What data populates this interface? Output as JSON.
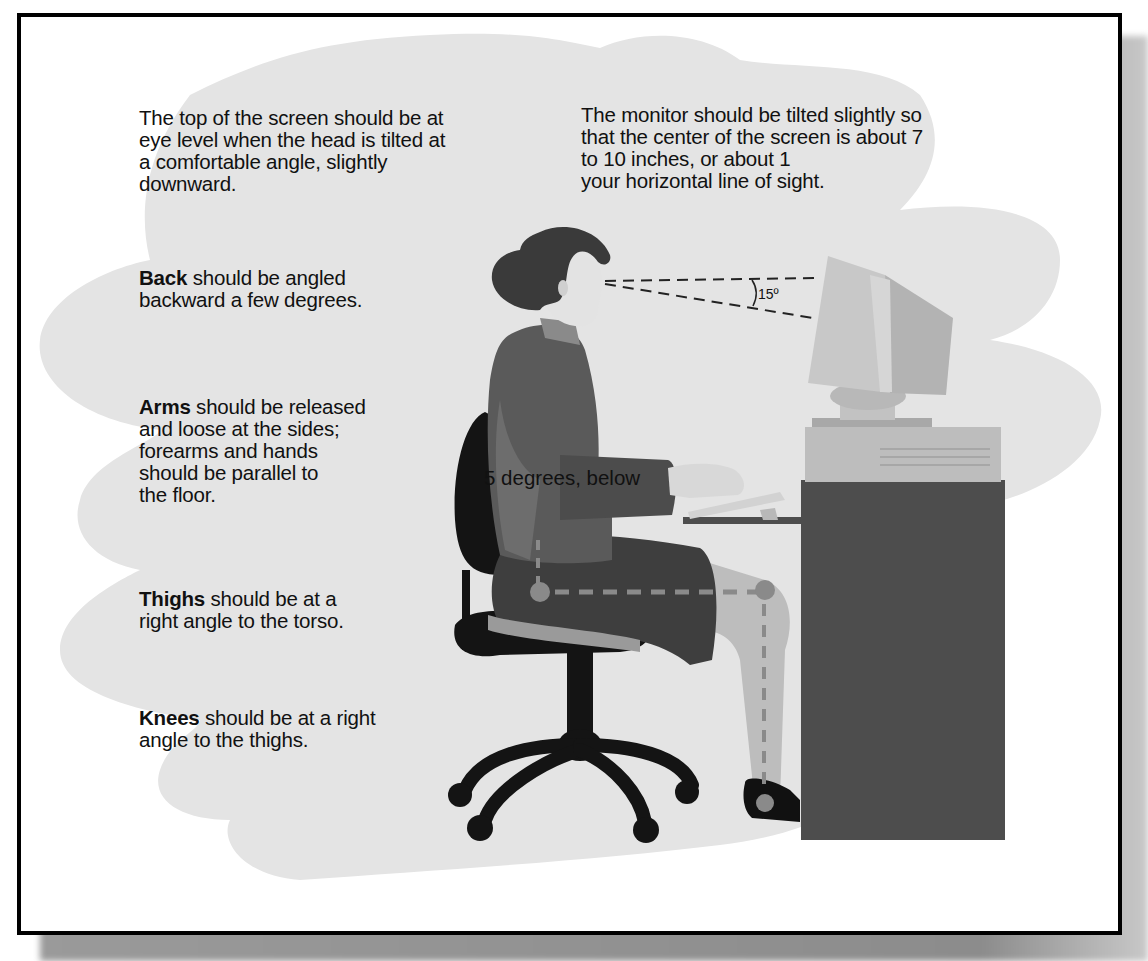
{
  "figure": {
    "colors": {
      "frame_border": "#000000",
      "background_blob": "#e4e4e4",
      "shadow": "#8c8c8c",
      "desk": "#4d4d4d",
      "clothing": "#5a5a5a",
      "chair": "#111111",
      "monitor": "#b9b9b9",
      "skin": "#e6e6e6",
      "guide_lines": "#222222",
      "joint_markers": "#8a8a8a"
    }
  },
  "captions": {
    "screen_top": "The top of the screen should be at\neye level when the head is tilted at\na comfortable angle, slightly\ndownward.",
    "monitor_tilt": "The monitor should be tilted slightly so\nthat the center of the screen is about 7\nto 10 inches, or about 1\nyour horizontal line of sight.",
    "back": {
      "term": "Back",
      "text": " should be angled\nbackward a few degrees."
    },
    "arms": {
      "term": "Arms",
      "text": " should be released\nand loose at the sides;\nforearms and hands\nshould be parallel to\nthe floor."
    },
    "thighs": {
      "term": "Thighs",
      "text": " should be at a\nright angle to the torso."
    },
    "knees": {
      "term": "Knees",
      "text": " should be at a right\nangle to the thighs."
    }
  },
  "annotations": {
    "sight_angle": "15º",
    "overlap_fragment": "5 degrees, below"
  }
}
